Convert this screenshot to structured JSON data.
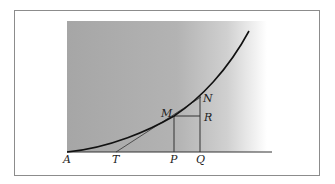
{
  "diagram": {
    "colors": {
      "frame": "#8c8c8c",
      "shading": "#a9a9a9",
      "curve": "#111111",
      "lines": "#333333"
    },
    "points": {
      "A": {
        "label": "A"
      },
      "T": {
        "label": "T"
      },
      "P": {
        "label": "P"
      },
      "Q": {
        "label": "Q"
      },
      "M": {
        "label": "M"
      },
      "N": {
        "label": "N"
      },
      "R": {
        "label": "R"
      }
    }
  }
}
